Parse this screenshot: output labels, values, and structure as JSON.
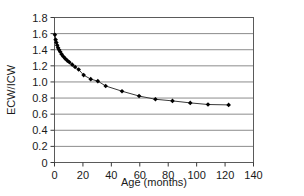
{
  "chart_data": {
    "type": "line",
    "title": "",
    "subtitle": "",
    "xlabel": "Age (months)",
    "ylabel": "ECW/ICW",
    "xlim": [
      0,
      140
    ],
    "ylim": [
      0,
      1.8
    ],
    "xticks": [
      0,
      20,
      40,
      60,
      80,
      100,
      120,
      140
    ],
    "yticks": [
      0,
      0.2,
      0.4,
      0.6,
      0.8,
      1.0,
      1.2,
      1.4,
      1.6,
      1.8
    ],
    "xtick_labels": [
      "0",
      "20",
      "40",
      "60",
      "80",
      "100",
      "120",
      "140"
    ],
    "ytick_labels": [
      "0",
      "0.2",
      "0.4",
      "0.6",
      "0.8",
      "1.0",
      "1.2",
      "1.4",
      "1.6",
      "1.8"
    ],
    "grid": "horizontal",
    "legend": "none",
    "marker": "diamond",
    "marker_color": "#000000",
    "line_color": "#3a3a3a",
    "series": [
      {
        "name": "ECW/ICW",
        "x": [
          0.3,
          0.8,
          1.3,
          1.9,
          2.5,
          3.2,
          4.0,
          5.0,
          6.2,
          7.5,
          9.0,
          10.5,
          12.5,
          14.5,
          17.0,
          20.5,
          25.5,
          30.5,
          36.0,
          47.5,
          59.5,
          71.0,
          83.0,
          95.5,
          108.0,
          122.5
        ],
        "y": [
          1.585,
          1.525,
          1.49,
          1.455,
          1.425,
          1.4,
          1.375,
          1.345,
          1.315,
          1.29,
          1.265,
          1.245,
          1.215,
          1.185,
          1.155,
          1.085,
          1.035,
          1.01,
          0.95,
          0.885,
          0.825,
          0.785,
          0.765,
          0.74,
          0.72,
          0.715
        ]
      }
    ]
  },
  "axes": {
    "xlabel": "Age (months)",
    "ylabel": "ECW/ICW"
  }
}
